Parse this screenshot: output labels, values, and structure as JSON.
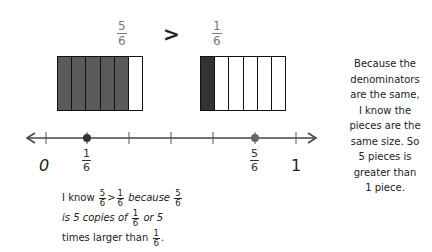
{
  "comparison": {
    "left_fraction": {
      "numerator": "5",
      "denominator": "6"
    },
    "operator": ">",
    "right_fraction": {
      "numerator": "1",
      "denominator": "6"
    }
  },
  "fraction_bars": [
    {
      "label": "5/6",
      "parts": 6,
      "shaded": 5,
      "shade_color": "#5a5a5a"
    },
    {
      "label": "1/6",
      "parts": 6,
      "shaded": 1,
      "shade_color": "#333333"
    }
  ],
  "number_line": {
    "start_label": "0",
    "end_label": "1",
    "ticks": 7,
    "points": [
      {
        "numerator": "1",
        "denominator": "6",
        "position": 1
      },
      {
        "numerator": "5",
        "denominator": "6",
        "position": 5
      }
    ],
    "line_color": "#444444",
    "point_colors": [
      "#333333",
      "#666666"
    ]
  },
  "side_note": {
    "lines": [
      "Because the",
      "denominators",
      "are the same,",
      "I know the",
      "pieces are the",
      "same size. So",
      "5 pieces is",
      "greater than",
      "1 piece."
    ]
  },
  "bottom_note": {
    "line1": {
      "pre": "I know",
      "f1n": "5",
      "f1d": "6",
      "op": ">",
      "f2n": "1",
      "f2d": "6",
      "mid": "because",
      "f3n": "5",
      "f3d": "6"
    },
    "line2": {
      "pre": "is 5 copies of",
      "fn": "1",
      "fd": "6",
      "post": "or 5"
    },
    "line3": {
      "pre": "times larger than",
      "fn": "1",
      "fd": "6",
      "post": "."
    }
  }
}
